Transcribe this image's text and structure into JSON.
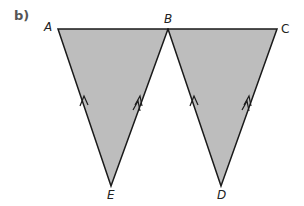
{
  "part_label": "b)",
  "points": {
    "A": {
      "label": "A",
      "x": 58,
      "y": 29
    },
    "B": {
      "label": "B",
      "x": 168,
      "y": 29
    },
    "C": {
      "label": "C",
      "x": 277,
      "y": 29
    },
    "E": {
      "label": "E",
      "x": 111,
      "y": 186
    },
    "D": {
      "label": "D",
      "x": 221,
      "y": 186
    }
  },
  "triangles": [
    {
      "name": "ABE",
      "vertices": [
        "A",
        "B",
        "E"
      ],
      "fill": "#bdbdbd"
    },
    {
      "name": "BCD",
      "vertices": [
        "B",
        "C",
        "D"
      ],
      "fill": "#bdbdbd"
    }
  ],
  "parallel_marks": [
    {
      "edge": "EA",
      "arrows": 1
    },
    {
      "edge": "EB",
      "arrows": 2
    },
    {
      "edge": "DB",
      "arrows": 1
    },
    {
      "edge": "DC",
      "arrows": 2
    }
  ],
  "colors": {
    "fill": "#bdbdbd",
    "stroke": "#1a1a1a"
  }
}
